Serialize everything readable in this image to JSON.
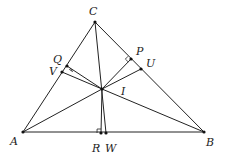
{
  "diagram": {
    "stroke_color": "#222222",
    "points": {
      "A": {
        "x": 23,
        "y": 132,
        "label": "A",
        "lx": 10,
        "ly": 145
      },
      "B": {
        "x": 204,
        "y": 132,
        "label": "B",
        "lx": 206,
        "ly": 146
      },
      "C": {
        "x": 95,
        "y": 22,
        "label": "C",
        "lx": 89,
        "ly": 15
      },
      "I": {
        "x": 102,
        "y": 89,
        "label": "I",
        "lx": 121,
        "ly": 95
      },
      "R": {
        "x": 101,
        "y": 133,
        "label": "R",
        "lx": 92,
        "ly": 152
      },
      "W": {
        "x": 106,
        "y": 133,
        "label": "W",
        "lx": 105,
        "ly": 152
      },
      "Q": {
        "x": 67,
        "y": 66,
        "label": "Q",
        "lx": 53,
        "ly": 63
      },
      "V": {
        "x": 62,
        "y": 72,
        "label": "V",
        "lx": 49,
        "ly": 75
      },
      "P": {
        "x": 131,
        "y": 59,
        "label": "P",
        "lx": 136,
        "ly": 55
      },
      "U": {
        "x": 141,
        "y": 69,
        "label": "U",
        "lx": 146,
        "ly": 67
      }
    },
    "segments": [
      [
        "A",
        "B"
      ],
      [
        "B",
        "C"
      ],
      [
        "C",
        "A"
      ],
      [
        "A",
        "I"
      ],
      [
        "B",
        "I"
      ],
      [
        "C",
        "W"
      ],
      [
        "I",
        "Q"
      ],
      [
        "I",
        "P"
      ],
      [
        "I",
        "R"
      ],
      [
        "I",
        "V"
      ],
      [
        "I",
        "U"
      ]
    ],
    "right_angles": [
      "Q",
      "P",
      "R"
    ]
  }
}
